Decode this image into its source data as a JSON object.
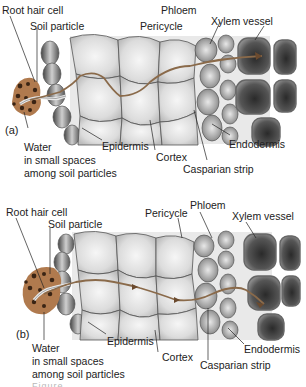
{
  "figure": {
    "colors": {
      "water_path": "#8a6a4a",
      "soil": "#b07a4e",
      "soil_dots": "#3a2414",
      "cell_outline": "#555555",
      "xylem_fill": "#3c3c3c",
      "leader_line": "#222222"
    }
  },
  "panels": [
    {
      "tag": "(a)",
      "labels": {
        "root_hair_cell": "Root hair cell",
        "soil_particle": "Soil particle",
        "pericycle": "Pericycle",
        "phloem": "Phloem",
        "xylem_vessel": "Xylem vessel",
        "water_line1": "Water",
        "water_line2": "in small spaces",
        "water_line3": "among soil particles",
        "epidermis": "Epidermis",
        "cortex": "Cortex",
        "endodermis": "Endodermis",
        "casparian_strip": "Casparian strip"
      }
    },
    {
      "tag": "(b)",
      "labels": {
        "root_hair_cell": "Root hair cell",
        "soil_particle": "Soil particle",
        "pericycle": "Pericycle",
        "phloem": "Phloem",
        "xylem_vessel": "Xylem vessel",
        "water_line1": "Water",
        "water_line2": "in small spaces",
        "water_line3": "among soil particles",
        "epidermis": "Epidermis",
        "cortex": "Cortex",
        "endodermis": "Endodermis",
        "casparian_strip": "Casparian strip"
      }
    }
  ],
  "caption": "Figure …"
}
